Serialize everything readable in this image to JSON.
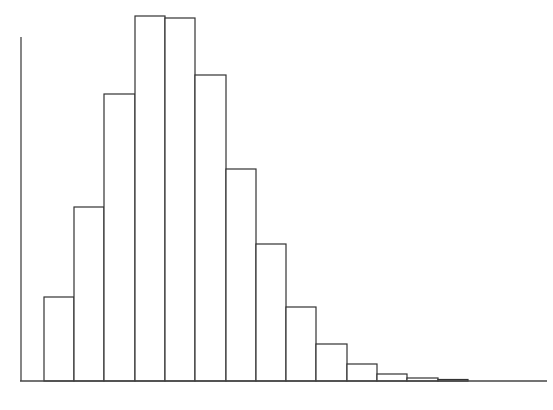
{
  "chart_data": {
    "type": "bar",
    "title": "",
    "xlabel": "",
    "ylabel": "",
    "grid": false,
    "legend": null,
    "bin_edges_px": [
      44,
      74,
      104,
      135,
      165,
      195,
      226,
      256,
      286,
      316,
      347,
      377,
      407,
      438,
      468
    ],
    "categories": [
      "1",
      "2",
      "3",
      "4",
      "5",
      "6",
      "7",
      "8",
      "9",
      "10",
      "11",
      "12",
      "13",
      "14"
    ],
    "values": [
      84,
      174,
      287,
      365,
      363,
      306,
      212,
      137,
      74,
      37,
      17,
      7,
      3,
      1.5
    ],
    "ylim": [
      0,
      365
    ],
    "style": {
      "bar_fill": "#ffffff",
      "bar_stroke": "#333333",
      "axis_color": "#444444"
    }
  },
  "layout": {
    "baseline_y": 381,
    "top_y": 16,
    "y_axis_x": 21,
    "y_axis_top": 37,
    "x_axis_start": 20,
    "x_axis_end": 547
  }
}
